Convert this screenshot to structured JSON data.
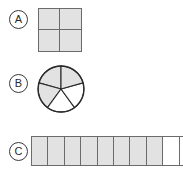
{
  "worksheet": {
    "background_color": "#ffffff",
    "shaded_color": "#e2e2e2",
    "unshaded_color": "#ffffff",
    "outline_color": "#6b6b6b",
    "label_color": "#2b2b2b"
  },
  "items": [
    {
      "label": "A",
      "shape": "square",
      "parts_total": 4,
      "parts_shaded": 4,
      "fraction": "4/4",
      "cells": [
        "shaded",
        "shaded",
        "shaded",
        "shaded"
      ]
    },
    {
      "label": "B",
      "shape": "circle",
      "parts_total": 5,
      "parts_shaded": 3,
      "fraction": "3/5",
      "sectors": [
        "shaded",
        "shaded",
        "shaded",
        "unshaded",
        "unshaded"
      ]
    },
    {
      "label": "C",
      "shape": "strip",
      "parts_total": 10,
      "parts_shaded": 8,
      "fraction": "8/10",
      "cells": [
        "shaded",
        "shaded",
        "shaded",
        "shaded",
        "shaded",
        "shaded",
        "shaded",
        "shaded",
        "unshaded",
        "unshaded"
      ]
    }
  ]
}
